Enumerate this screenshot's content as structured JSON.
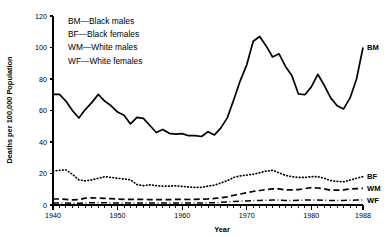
{
  "chart_data": {
    "type": "line",
    "title": "",
    "xlabel": "Year",
    "ylabel": "Deaths per 100,000 Population",
    "xlim": [
      1940,
      1988
    ],
    "ylim": [
      0,
      120
    ],
    "yticks": [
      0,
      20,
      40,
      60,
      80,
      100,
      120
    ],
    "xticks": [
      1940,
      1950,
      1960,
      1970,
      1980,
      1988
    ],
    "xtick_labels": [
      "1940",
      "1950",
      "1960",
      "1970",
      "1980",
      "1988"
    ],
    "ytick_labels": [
      "0",
      "20",
      "40",
      "60",
      "80",
      "100",
      "120"
    ],
    "grid": false,
    "legend_position": "upper-left-inside",
    "minor_tick_interval": 1,
    "x": [
      1940,
      1941,
      1942,
      1943,
      1944,
      1945,
      1946,
      1947,
      1948,
      1949,
      1950,
      1951,
      1952,
      1953,
      1954,
      1955,
      1956,
      1957,
      1958,
      1959,
      1960,
      1961,
      1962,
      1963,
      1964,
      1965,
      1966,
      1967,
      1968,
      1969,
      1970,
      1971,
      1972,
      1973,
      1974,
      1975,
      1976,
      1977,
      1978,
      1979,
      1980,
      1981,
      1982,
      1983,
      1984,
      1985,
      1986,
      1987,
      1988
    ],
    "series": [
      {
        "name": "BM",
        "label": "BM",
        "legend": "BM—Black males",
        "line_style": "solid",
        "values": [
          70.3,
          70.2,
          66.0,
          60.0,
          55.2,
          60.6,
          65.0,
          70.2,
          66.0,
          63.0,
          59.0,
          57.0,
          51.5,
          55.6,
          55.0,
          50.5,
          46.0,
          48.0,
          45.5,
          45.0,
          45.3,
          44.0,
          44.0,
          43.5,
          46.5,
          44.5,
          49.0,
          55.5,
          67.0,
          79.0,
          89.0,
          104.0,
          107.0,
          101.0,
          94.0,
          96.0,
          88.0,
          82.0,
          70.5,
          70.0,
          75.0,
          83.0,
          76.0,
          68.0,
          63.0,
          61.0,
          68.0,
          80.0,
          100.0
        ]
      },
      {
        "name": "BF",
        "label": "BF",
        "legend": "BF—Black females",
        "line_style": "dotted",
        "values": [
          21.5,
          22.0,
          22.3,
          19.5,
          16.0,
          15.3,
          16.0,
          17.0,
          18.0,
          17.5,
          17.0,
          16.5,
          16.0,
          13.0,
          12.3,
          12.8,
          12.3,
          12.0,
          12.0,
          12.2,
          11.8,
          11.5,
          11.2,
          11.2,
          12.0,
          12.6,
          14.0,
          15.5,
          17.5,
          18.5,
          19.0,
          19.5,
          20.5,
          21.5,
          22.0,
          20.5,
          18.8,
          18.0,
          17.5,
          17.5,
          18.0,
          18.0,
          17.0,
          15.5,
          15.0,
          14.8,
          15.8,
          17.0,
          18.0
        ]
      },
      {
        "name": "WM",
        "label": "WM",
        "legend": "WM—White males",
        "line_style": "dashed",
        "values": [
          3.8,
          3.8,
          3.6,
          3.2,
          3.4,
          4.4,
          4.6,
          4.4,
          4.2,
          4.0,
          3.8,
          3.6,
          3.6,
          3.6,
          3.6,
          3.4,
          3.4,
          3.4,
          3.4,
          3.6,
          3.6,
          3.5,
          3.6,
          3.7,
          3.9,
          4.2,
          4.6,
          5.2,
          6.2,
          7.0,
          7.8,
          8.6,
          9.2,
          9.8,
          10.2,
          10.2,
          9.6,
          9.6,
          9.8,
          10.4,
          11.0,
          10.8,
          10.2,
          9.4,
          9.4,
          9.6,
          10.2,
          10.4,
          10.6
        ]
      },
      {
        "name": "WF",
        "label": "WF",
        "legend": "WF—White females",
        "line_style": "dash-dot",
        "values": [
          1.3,
          1.3,
          1.2,
          1.1,
          1.1,
          1.3,
          1.4,
          1.4,
          1.4,
          1.3,
          1.3,
          1.2,
          1.2,
          1.2,
          1.2,
          1.2,
          1.2,
          1.2,
          1.2,
          1.3,
          1.3,
          1.3,
          1.3,
          1.3,
          1.4,
          1.5,
          1.7,
          1.9,
          2.2,
          2.4,
          2.6,
          2.8,
          2.9,
          3.0,
          3.1,
          3.1,
          2.9,
          2.9,
          3.0,
          3.1,
          3.2,
          3.2,
          3.0,
          2.9,
          2.9,
          2.9,
          3.0,
          3.1,
          3.1
        ]
      }
    ]
  },
  "legend": {
    "items": [
      "BM—Black males",
      "BF—Black females",
      "WM—White males",
      "WF—White females"
    ]
  },
  "axes": {
    "y_title": "Deaths per 100,000 Population",
    "x_title": "Year"
  }
}
